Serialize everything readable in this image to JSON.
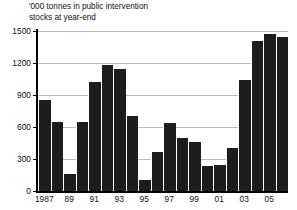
{
  "chart_data": {
    "type": "bar",
    "title": "'000 tonnes in public intervention\nstocks at year-end",
    "title_line1": "'000 tonnes in public intervention",
    "title_line2": "stocks at year-end",
    "xlabel": "",
    "ylabel": "",
    "ylim": [
      0,
      1500
    ],
    "yticks": [
      0,
      300,
      600,
      900,
      1200,
      1500
    ],
    "ytick_labels": [
      "0",
      "300",
      "600",
      "900",
      "1200",
      "1500"
    ],
    "grid": true,
    "legend": null,
    "bar_color": "#1d1d1d",
    "categories": [
      "1987",
      "1988",
      "1989",
      "1990",
      "1991",
      "1992",
      "1993",
      "1994",
      "1995",
      "1996",
      "1997",
      "1998",
      "1999",
      "2000",
      "2001",
      "2002",
      "2003",
      "2004",
      "2005",
      "2006"
    ],
    "xtick_labels": [
      "1987",
      "89",
      "91",
      "93",
      "95",
      "97",
      "99",
      "01",
      "03",
      "05"
    ],
    "xtick_categories": [
      "1987",
      "1989",
      "1991",
      "1993",
      "1995",
      "1997",
      "1999",
      "2001",
      "2003",
      "2005"
    ],
    "values": [
      855,
      645,
      160,
      645,
      1020,
      1180,
      1140,
      700,
      105,
      370,
      640,
      500,
      455,
      230,
      240,
      405,
      1040,
      1410,
      1470,
      1445
    ]
  }
}
